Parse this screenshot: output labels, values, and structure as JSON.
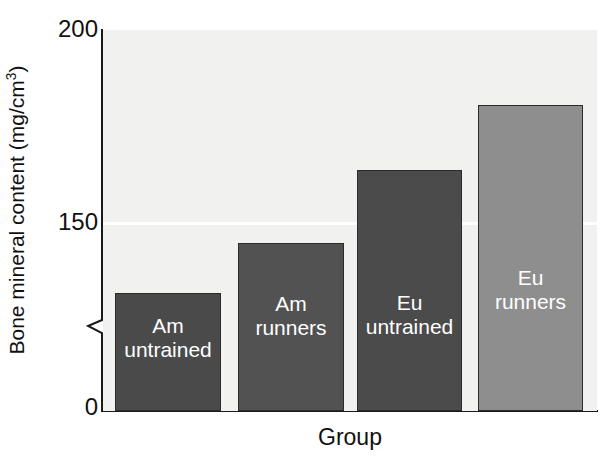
{
  "chart_data": {
    "type": "bar",
    "title": "",
    "subtitle": "",
    "xlabel": "Group",
    "ylabel": "Bone mineral content (mg/cm",
    "ylabel_sup": "3",
    "ylabel_tail": ")",
    "ylabel_full": "Bone mineral content (mg/cm3)",
    "categories": [
      "Am untrained",
      "Am runners",
      "Eu untrained",
      "Eu runners"
    ],
    "values": [
      132,
      145,
      164,
      181
    ],
    "ylim": [
      0,
      200
    ],
    "yticks": [
      "200",
      "150",
      "0"
    ],
    "ytick_values": [
      200,
      150,
      0
    ],
    "axis_break": true,
    "axis_break_note": "y-axis broken between 0 and ~140",
    "grid": "single white gridline at 150",
    "legend": "none; each bar is labeled in-place",
    "bars": [
      {
        "label": "Am\nuntrained",
        "label_line1": "Am",
        "label_line2": "untrained",
        "value": 132,
        "color": "#4a4a4a",
        "top_px": 292,
        "left_px": 115,
        "width_px": 106
      },
      {
        "label": "Am\nrunners",
        "label_line1": "Am",
        "label_line2": "runners",
        "value": 145,
        "color": "#525252",
        "top_px": 242,
        "left_px": 238,
        "width_px": 106
      },
      {
        "label": "Eu\nuntrained",
        "label_line1": "Eu",
        "label_line2": "untrained",
        "value": 164,
        "color": "#4b4b4b",
        "top_px": 169,
        "left_px": 357,
        "width_px": 105
      },
      {
        "label": "Eu\nrunners",
        "label_line1": "Eu",
        "label_line2": "runners",
        "value": 181,
        "color": "#8e8e8e",
        "top_px": 104,
        "left_px": 478,
        "width_px": 105
      }
    ],
    "colors": {
      "plot_background": "#f1f1ef",
      "axis": "#1a1a1a",
      "gridline": "#ffffff",
      "bar_dark": "#4a4a4a",
      "bar_light": "#8e8e8e",
      "text": "#111111",
      "bar_label_text": "#ffffff"
    }
  }
}
